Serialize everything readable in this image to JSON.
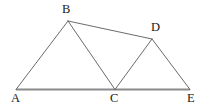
{
  "figure": {
    "background_color": "#ffffff",
    "width": 208,
    "height": 109,
    "stroke_color_edges": "#6b6b6b",
    "stroke_color_baseline": "#8a8a8a",
    "label_color": "#1b1b1b",
    "vertices": [
      {
        "id": "A",
        "label": "A",
        "x": 16,
        "y": 89
      },
      {
        "id": "B",
        "label": "B",
        "x": 68,
        "y": 21
      },
      {
        "id": "C",
        "label": "C",
        "x": 115,
        "y": 89
      },
      {
        "id": "D",
        "label": "D",
        "x": 152,
        "y": 39
      },
      {
        "id": "E",
        "label": "E",
        "x": 190,
        "y": 89
      }
    ],
    "edges": [
      {
        "id": "AE",
        "from": "A",
        "to": "E",
        "style": "baseline"
      },
      {
        "id": "AB",
        "from": "A",
        "to": "B",
        "style": "thin"
      },
      {
        "id": "BC",
        "from": "B",
        "to": "C",
        "style": "thin"
      },
      {
        "id": "BD",
        "from": "B",
        "to": "D",
        "style": "thin"
      },
      {
        "id": "CD",
        "from": "C",
        "to": "D",
        "style": "thin"
      },
      {
        "id": "DE",
        "from": "D",
        "to": "E",
        "style": "thin"
      }
    ],
    "labels": {
      "A": "A",
      "B": "B",
      "C": "C",
      "D": "D",
      "E": "E"
    }
  }
}
